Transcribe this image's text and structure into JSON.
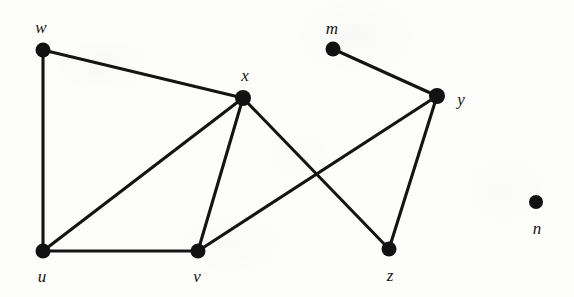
{
  "figure": {
    "type": "undirected-graph-diagram",
    "background_color": "#fdfdfc",
    "ink_color": "#141414",
    "width": 574,
    "height": 297
  },
  "nodes": [
    {
      "id": "w",
      "label": "w",
      "cx": 43,
      "cy": 50,
      "r": 7.5,
      "label_x": 41,
      "label_y": 27,
      "isolated": false
    },
    {
      "id": "x",
      "label": "x",
      "cx": 243,
      "cy": 98,
      "r": 8.0,
      "label_x": 245,
      "label_y": 75,
      "isolated": false
    },
    {
      "id": "m",
      "label": "m",
      "cx": 333,
      "cy": 49,
      "r": 7.5,
      "label_x": 332,
      "label_y": 28,
      "isolated": false
    },
    {
      "id": "y",
      "label": "y",
      "cx": 437,
      "cy": 96,
      "r": 8.0,
      "label_x": 461,
      "label_y": 99,
      "isolated": false
    },
    {
      "id": "u",
      "label": "u",
      "cx": 43,
      "cy": 251,
      "r": 7.5,
      "label_x": 42,
      "label_y": 276,
      "isolated": false
    },
    {
      "id": "v",
      "label": "v",
      "cx": 198,
      "cy": 251,
      "r": 7.5,
      "label_x": 197,
      "label_y": 276,
      "isolated": false
    },
    {
      "id": "z",
      "label": "z",
      "cx": 389,
      "cy": 249,
      "r": 7.5,
      "label_x": 390,
      "label_y": 275,
      "isolated": false
    },
    {
      "id": "n",
      "label": "n",
      "cx": 536,
      "cy": 202,
      "r": 7.0,
      "label_x": 537,
      "label_y": 228,
      "isolated": true
    }
  ],
  "edges": [
    {
      "id": "edge-w-x",
      "from": "w",
      "to": "x"
    },
    {
      "id": "edge-w-u",
      "from": "w",
      "to": "u"
    },
    {
      "id": "edge-u-x",
      "from": "u",
      "to": "x"
    },
    {
      "id": "edge-u-v",
      "from": "u",
      "to": "v"
    },
    {
      "id": "edge-x-v",
      "from": "x",
      "to": "v"
    },
    {
      "id": "edge-x-z",
      "from": "x",
      "to": "z"
    },
    {
      "id": "edge-v-y",
      "from": "v",
      "to": "y"
    },
    {
      "id": "edge-m-y",
      "from": "m",
      "to": "y"
    },
    {
      "id": "edge-y-z",
      "from": "y",
      "to": "z"
    }
  ]
}
